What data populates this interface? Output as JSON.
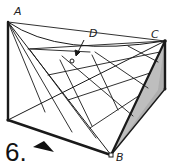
{
  "figure": {
    "number_label": "6.",
    "points": {
      "A": "A",
      "B": "B",
      "C": "C",
      "D": "D"
    },
    "colors": {
      "stroke": "#1a1a1a",
      "shade": "#8a8a8a",
      "background": "#ffffff"
    }
  }
}
